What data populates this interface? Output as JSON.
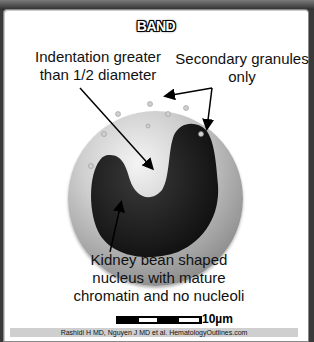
{
  "title": "BAND",
  "labels": {
    "indentation": [
      "Indentation greater",
      "than 1/2 diameter"
    ],
    "granules": [
      "Secondary granules",
      "only"
    ],
    "nucleus": [
      "Kidney bean shaped",
      "nucleus with mature",
      "chromatin and no nucleoli"
    ]
  },
  "scale": {
    "label": "10µm"
  },
  "credit": "Rashidi H MD, Nguyen J MD et al. HematologyOutlines.com",
  "colors": {
    "background": "#ffffff",
    "nucleus": "#1a1a1a",
    "cytoplasm": "#b5b5b5",
    "credit_bar": "#cfcfcf"
  }
}
